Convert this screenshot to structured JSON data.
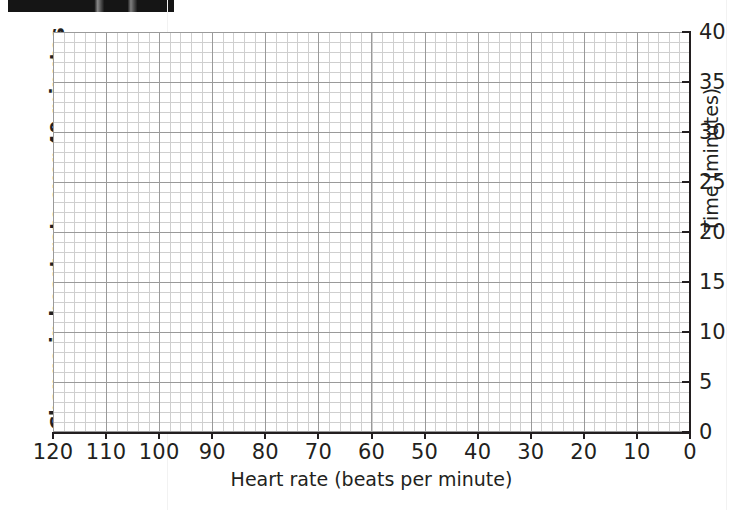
{
  "header": {
    "redaction_bar": ""
  },
  "chart_data": {
    "type": "scatter",
    "title": "",
    "side_title": "Change in heart rate over 40 minutes",
    "xlabel": "Heart rate (beats per minute)",
    "ylabel": "Time (minutes)",
    "x_ticks": [
      120,
      110,
      100,
      90,
      80,
      70,
      60,
      50,
      40,
      30,
      20,
      10,
      0
    ],
    "y_ticks": [
      0,
      5,
      10,
      15,
      20,
      25,
      30,
      35,
      40
    ],
    "xlim": [
      120,
      0
    ],
    "ylim": [
      0,
      40
    ],
    "x_axis_reversed": true,
    "y_axis_position": "right",
    "x_minor_per_major": 5,
    "y_minor_per_major": 5,
    "grid": true,
    "grid_color": "#cfcfcf",
    "grid_major_color": "#9a9a9a",
    "axis_color": "#231f20",
    "background": "#ffffff",
    "series": [],
    "values": [],
    "categories": [],
    "annotations": []
  }
}
